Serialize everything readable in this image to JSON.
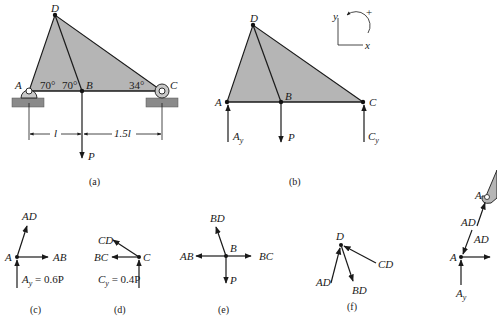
{
  "figure": {
    "panels": [
      {
        "id": "a",
        "caption": "(a)",
        "description": "Truss ABCD supported by pin at A and roller at C with load P at B"
      },
      {
        "id": "b",
        "caption": "(b)",
        "description": "Free-body diagram of entire truss"
      },
      {
        "id": "c",
        "caption": "(c)",
        "description": "Free-body diagram of joint A"
      },
      {
        "id": "d",
        "caption": "(d)",
        "description": "Free-body diagram of joint C"
      },
      {
        "id": "e",
        "caption": "(e)",
        "description": "Free-body diagram of joint B"
      },
      {
        "id": "f",
        "caption": "(f)",
        "description": "Free-body diagram of joint D"
      }
    ],
    "colors": {
      "member_fill": "#b5b5b5",
      "ground": "#8a8a8a",
      "line": "#1a1a1a"
    }
  },
  "panel_a": {
    "nodes": {
      "A": "A",
      "B": "B",
      "C": "C",
      "D": "D"
    },
    "angles": {
      "angle_A": "70°",
      "angle_B": "70°",
      "angle_C": "34°"
    },
    "dims": {
      "AB": "l",
      "BC": "1.5l"
    },
    "load": "P"
  },
  "panel_b": {
    "nodes": {
      "A": "A",
      "B": "B",
      "C": "C",
      "D": "D"
    },
    "reactions": {
      "Ay_main": "A",
      "Ay_sub": "y",
      "Cy_main": "C",
      "Cy_sub": "y"
    },
    "load": "P",
    "axes": {
      "x": "x",
      "y": "y",
      "sign": "+"
    }
  },
  "panel_c": {
    "node": "A",
    "forces": {
      "AD": "AD",
      "AB": "AB"
    },
    "reaction": {
      "main": "A",
      "sub": "y",
      "value": " = 0.6P"
    }
  },
  "panel_d": {
    "node": "C",
    "forces": {
      "CD": "CD",
      "BC": "BC"
    },
    "reaction": {
      "main": "C",
      "sub": "y",
      "value": " = 0.4P"
    }
  },
  "panel_e": {
    "node": "B",
    "forces": {
      "BD": "BD",
      "AB": "AB",
      "BC": "BC",
      "P": "P"
    }
  },
  "panel_f": {
    "node": "D",
    "forces": {
      "AD": "AD",
      "CD": "CD",
      "BD": "BD"
    }
  },
  "panel_partial": {
    "node_top": "A",
    "force_top": "AD",
    "force_bottom": "AD",
    "node_bottom": "A",
    "reaction": {
      "main": "A",
      "sub": "y"
    }
  }
}
